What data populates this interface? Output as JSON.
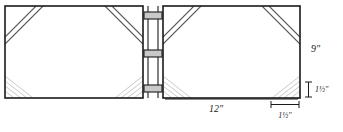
{
  "figure": {
    "type": "technical-drawing",
    "background_color": "#ffffff",
    "line_color": "#1a1a1a",
    "miter_band_color": "#4a4a4a",
    "corner_hatch_color": "#b8b8b8",
    "hinge_fill_color": "#c9c9c9",
    "panels": [
      {
        "name": "left-panel",
        "x": 5,
        "y": 6,
        "width": 138,
        "height": 92
      },
      {
        "name": "right-panel",
        "x": 163,
        "y": 6,
        "width": 137,
        "height": 92
      }
    ],
    "hinges": [
      {
        "name": "hinge-tab-top",
        "y": 12,
        "height": 7
      },
      {
        "name": "hinge-tab-middle",
        "y": 50,
        "height": 7
      },
      {
        "name": "hinge-tab-bottom",
        "y": 85,
        "height": 7
      }
    ],
    "dimensions": [
      {
        "name": "height-dimension",
        "label": "9\"",
        "value": 9,
        "unit": "inch",
        "orientation": "vertical",
        "measures": "panel height"
      },
      {
        "name": "width-dimension",
        "label": "12\"",
        "value": 12,
        "unit": "inch",
        "orientation": "horizontal",
        "measures": "panel width"
      },
      {
        "name": "corner-height-dimension",
        "label": "1½\"",
        "value": 1.5,
        "unit": "inch",
        "orientation": "vertical",
        "measures": "corner miter height"
      },
      {
        "name": "corner-width-dimension",
        "label": "1½\"",
        "value": 1.5,
        "unit": "inch",
        "orientation": "horizontal",
        "measures": "corner miter width"
      }
    ]
  }
}
